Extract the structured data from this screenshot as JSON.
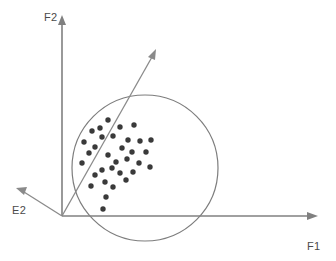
{
  "figure": {
    "background_color": "#ffffff",
    "width": 336,
    "height": 261
  },
  "labels": {
    "f1": "F1",
    "f2": "F2",
    "e2": "E2"
  },
  "colors": {
    "axis": "#808080",
    "vector": "#8a8a8a",
    "outline": "#7d7d7d",
    "point": "#3a3a3a",
    "text": "#4a4a4a"
  },
  "chart_data": {
    "type": "scatter",
    "title": "",
    "xlabel": "F1",
    "ylabel": "F2",
    "grid": false,
    "legend": "none",
    "origin": [
      62,
      216
    ],
    "axes": [
      {
        "name": "F1",
        "kind": "horizontal-axis",
        "from": [
          62,
          216
        ],
        "to": [
          316,
          216
        ],
        "arrow": true,
        "label": "F1",
        "label_pos": [
          307,
          246
        ]
      },
      {
        "name": "F2",
        "kind": "vertical-axis",
        "from": [
          62,
          216
        ],
        "to": [
          62,
          18
        ],
        "arrow": true,
        "label": "F2",
        "label_pos": [
          44,
          17
        ]
      }
    ],
    "vectors": [
      {
        "name": "E1",
        "kind": "principal-component-arrow",
        "from": [
          62,
          216
        ],
        "to": [
          155,
          51
        ],
        "arrow": true,
        "label": ""
      },
      {
        "name": "E2",
        "kind": "secondary-component-arrow",
        "from": [
          62,
          216
        ],
        "to": [
          18,
          189
        ],
        "arrow": true,
        "label": "E2",
        "label_pos": [
          14,
          213
        ]
      }
    ],
    "cluster_outline": {
      "shape": "circle",
      "center": [
        145,
        168
      ],
      "radius": 73
    },
    "points": [
      [
        108,
        120
      ],
      [
        100,
        128
      ],
      [
        92,
        131
      ],
      [
        120,
        127
      ],
      [
        134,
        125
      ],
      [
        102,
        137
      ],
      [
        113,
        136
      ],
      [
        84,
        142
      ],
      [
        95,
        147
      ],
      [
        128,
        140
      ],
      [
        140,
        141
      ],
      [
        151,
        140
      ],
      [
        122,
        148
      ],
      [
        89,
        153
      ],
      [
        108,
        155
      ],
      [
        132,
        152
      ],
      [
        146,
        152
      ],
      [
        82,
        163
      ],
      [
        116,
        162
      ],
      [
        127,
        159
      ],
      [
        139,
        163
      ],
      [
        102,
        170
      ],
      [
        112,
        168
      ],
      [
        150,
        167
      ],
      [
        95,
        175
      ],
      [
        120,
        173
      ],
      [
        133,
        172
      ],
      [
        105,
        182
      ],
      [
        126,
        180
      ],
      [
        91,
        186
      ],
      [
        113,
        187
      ],
      [
        106,
        197
      ],
      [
        103,
        209
      ]
    ],
    "point_count": 33,
    "point_radius": 2.7
  }
}
